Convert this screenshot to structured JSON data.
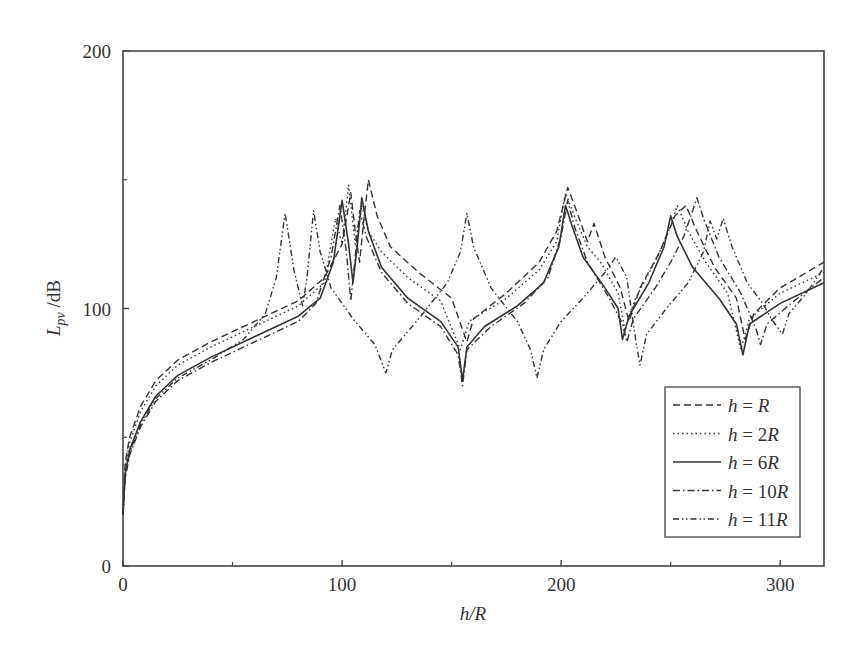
{
  "chart_data": {
    "type": "line",
    "title": "",
    "xlabel": "h/R",
    "ylabel": "L_pv /dB",
    "xlim": [
      0,
      320
    ],
    "ylim": [
      0,
      200
    ],
    "x_ticks": [
      0,
      100,
      200,
      300
    ],
    "x_minor_ticks": [
      50,
      150,
      250
    ],
    "y_ticks": [
      0,
      100,
      200
    ],
    "y_minor_ticks": [
      50,
      150
    ],
    "grid": false,
    "legend_position": "lower right",
    "series": [
      {
        "name": "h = R",
        "legend_var": "h",
        "legend_val": "R",
        "style": "dashed",
        "points": [
          [
            0,
            20
          ],
          [
            1,
            40
          ],
          [
            3,
            50
          ],
          [
            8,
            62
          ],
          [
            15,
            72
          ],
          [
            25,
            80
          ],
          [
            40,
            87
          ],
          [
            60,
            95
          ],
          [
            80,
            103
          ],
          [
            92,
            112
          ],
          [
            100,
            125
          ],
          [
            104,
            145
          ],
          [
            106,
            130
          ],
          [
            108,
            118
          ],
          [
            110,
            135
          ],
          [
            112,
            150
          ],
          [
            116,
            136
          ],
          [
            122,
            124
          ],
          [
            135,
            114
          ],
          [
            150,
            104
          ],
          [
            157,
            87
          ],
          [
            160,
            96
          ],
          [
            175,
            106
          ],
          [
            190,
            118
          ],
          [
            198,
            130
          ],
          [
            203,
            147
          ],
          [
            207,
            138
          ],
          [
            212,
            126
          ],
          [
            215,
            133
          ],
          [
            220,
            120
          ],
          [
            227,
            108
          ],
          [
            231,
            95
          ],
          [
            236,
            108
          ],
          [
            245,
            122
          ],
          [
            252,
            136
          ],
          [
            257,
            140
          ],
          [
            262,
            130
          ],
          [
            270,
            116
          ],
          [
            280,
            104
          ],
          [
            284,
            88
          ],
          [
            288,
            98
          ],
          [
            300,
            108
          ],
          [
            320,
            118
          ]
        ]
      },
      {
        "name": "h = 2R",
        "legend_var": "h",
        "legend_val": "2R",
        "style": "dotted",
        "points": [
          [
            0,
            20
          ],
          [
            1,
            38
          ],
          [
            3,
            48
          ],
          [
            8,
            60
          ],
          [
            15,
            70
          ],
          [
            25,
            78
          ],
          [
            40,
            85
          ],
          [
            60,
            93
          ],
          [
            80,
            101
          ],
          [
            92,
            110
          ],
          [
            97,
            135
          ],
          [
            100,
            125
          ],
          [
            103,
            148
          ],
          [
            106,
            125
          ],
          [
            109,
            140
          ],
          [
            112,
            130
          ],
          [
            118,
            122
          ],
          [
            130,
            112
          ],
          [
            145,
            103
          ],
          [
            154,
            84
          ],
          [
            158,
            95
          ],
          [
            175,
            104
          ],
          [
            190,
            115
          ],
          [
            198,
            126
          ],
          [
            202,
            145
          ],
          [
            206,
            136
          ],
          [
            212,
            124
          ],
          [
            218,
            118
          ],
          [
            226,
            106
          ],
          [
            229,
            92
          ],
          [
            234,
            104
          ],
          [
            244,
            120
          ],
          [
            250,
            132
          ],
          [
            253,
            140
          ],
          [
            258,
            130
          ],
          [
            266,
            118
          ],
          [
            276,
            106
          ],
          [
            282,
            84
          ],
          [
            286,
            96
          ],
          [
            300,
            106
          ],
          [
            320,
            114
          ]
        ]
      },
      {
        "name": "h = 6R",
        "legend_var": "h",
        "legend_val": "6R",
        "style": "solid",
        "points": [
          [
            0,
            20
          ],
          [
            1,
            36
          ],
          [
            3,
            45
          ],
          [
            8,
            56
          ],
          [
            15,
            66
          ],
          [
            25,
            74
          ],
          [
            40,
            81
          ],
          [
            60,
            89
          ],
          [
            80,
            97
          ],
          [
            90,
            104
          ],
          [
            96,
            118
          ],
          [
            100,
            142
          ],
          [
            103,
            125
          ],
          [
            105,
            110
          ],
          [
            107,
            125
          ],
          [
            109,
            143
          ],
          [
            112,
            130
          ],
          [
            118,
            116
          ],
          [
            130,
            104
          ],
          [
            145,
            95
          ],
          [
            153,
            85
          ],
          [
            155,
            72
          ],
          [
            157,
            85
          ],
          [
            165,
            93
          ],
          [
            180,
            101
          ],
          [
            192,
            110
          ],
          [
            199,
            124
          ],
          [
            202,
            140
          ],
          [
            205,
            132
          ],
          [
            210,
            120
          ],
          [
            220,
            108
          ],
          [
            226,
            100
          ],
          [
            228,
            88
          ],
          [
            231,
            97
          ],
          [
            240,
            110
          ],
          [
            247,
            124
          ],
          [
            250,
            136
          ],
          [
            253,
            128
          ],
          [
            260,
            116
          ],
          [
            272,
            104
          ],
          [
            280,
            94
          ],
          [
            283,
            82
          ],
          [
            286,
            94
          ],
          [
            300,
            102
          ],
          [
            320,
            110
          ]
        ]
      },
      {
        "name": "h = 10R",
        "legend_var": "h",
        "legend_val": "10R",
        "style": "dashdot",
        "points": [
          [
            0,
            20
          ],
          [
            1,
            34
          ],
          [
            3,
            43
          ],
          [
            8,
            54
          ],
          [
            15,
            64
          ],
          [
            25,
            72
          ],
          [
            40,
            79
          ],
          [
            60,
            87
          ],
          [
            80,
            95
          ],
          [
            88,
            102
          ],
          [
            95,
            120
          ],
          [
            99,
            140
          ],
          [
            102,
            122
          ],
          [
            104,
            103
          ],
          [
            106,
            120
          ],
          [
            108,
            138
          ],
          [
            111,
            128
          ],
          [
            118,
            114
          ],
          [
            130,
            102
          ],
          [
            145,
            93
          ],
          [
            153,
            82
          ],
          [
            155,
            70
          ],
          [
            157,
            84
          ],
          [
            168,
            93
          ],
          [
            183,
            102
          ],
          [
            194,
            112
          ],
          [
            200,
            128
          ],
          [
            203,
            142
          ],
          [
            206,
            132
          ],
          [
            212,
            118
          ],
          [
            222,
            104
          ],
          [
            228,
            94
          ],
          [
            230,
            87
          ],
          [
            233,
            96
          ],
          [
            243,
            108
          ],
          [
            250,
            118
          ],
          [
            256,
            128
          ],
          [
            260,
            138
          ],
          [
            262,
            143
          ],
          [
            265,
            135
          ],
          [
            272,
            120
          ],
          [
            282,
            106
          ],
          [
            289,
            92
          ],
          [
            291,
            86
          ],
          [
            294,
            94
          ],
          [
            305,
            102
          ],
          [
            320,
            112
          ]
        ]
      },
      {
        "name": "h = 11R",
        "legend_var": "h",
        "legend_val": "11R",
        "style": "dashdotdot",
        "points": [
          [
            0,
            20
          ],
          [
            1,
            35
          ],
          [
            3,
            44
          ],
          [
            8,
            55
          ],
          [
            15,
            65
          ],
          [
            25,
            73
          ],
          [
            40,
            80
          ],
          [
            55,
            88
          ],
          [
            65,
            98
          ],
          [
            70,
            112
          ],
          [
            74,
            137
          ],
          [
            78,
            115
          ],
          [
            82,
            101
          ],
          [
            84,
            112
          ],
          [
            87,
            138
          ],
          [
            90,
            122
          ],
          [
            95,
            108
          ],
          [
            105,
            96
          ],
          [
            115,
            86
          ],
          [
            120,
            75
          ],
          [
            123,
            84
          ],
          [
            135,
            96
          ],
          [
            148,
            110
          ],
          [
            154,
            122
          ],
          [
            157,
            137
          ],
          [
            160,
            124
          ],
          [
            168,
            108
          ],
          [
            180,
            95
          ],
          [
            186,
            84
          ],
          [
            189,
            73
          ],
          [
            192,
            84
          ],
          [
            200,
            95
          ],
          [
            210,
            104
          ],
          [
            220,
            114
          ],
          [
            225,
            120
          ],
          [
            230,
            112
          ],
          [
            234,
            88
          ],
          [
            236,
            78
          ],
          [
            239,
            90
          ],
          [
            248,
            100
          ],
          [
            258,
            110
          ],
          [
            265,
            122
          ],
          [
            268,
            134
          ],
          [
            271,
            127
          ],
          [
            274,
            135
          ],
          [
            278,
            124
          ],
          [
            285,
            110
          ],
          [
            292,
            102
          ],
          [
            296,
            96
          ],
          [
            301,
            90
          ],
          [
            304,
            98
          ],
          [
            312,
            106
          ],
          [
            320,
            116
          ]
        ]
      }
    ]
  }
}
